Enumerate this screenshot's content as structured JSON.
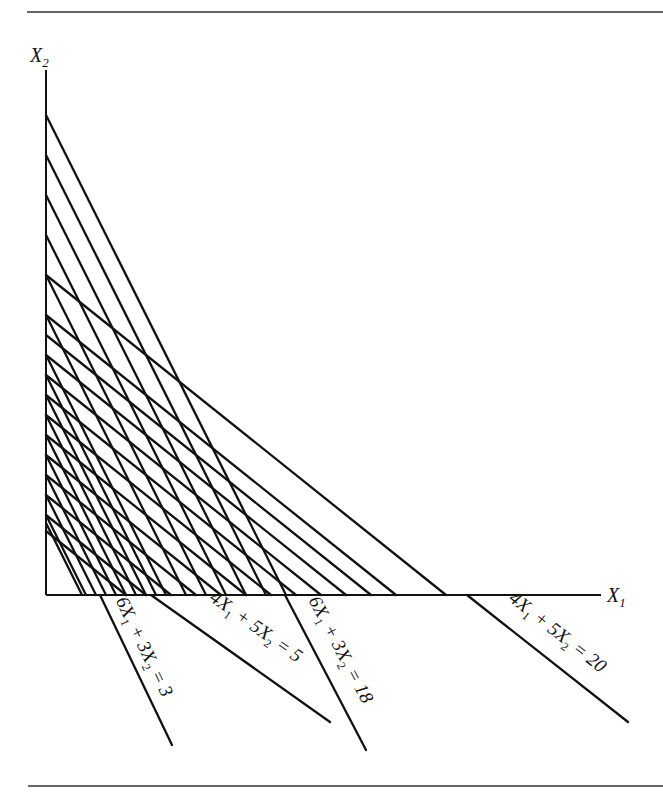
{
  "figure": {
    "top_rule": {
      "x1": 27,
      "x2": 663,
      "y": 12
    },
    "bottom_rule": {
      "x1": 28,
      "x2": 663,
      "y": 786
    },
    "origin": {
      "x": 46,
      "y": 595
    },
    "axes": {
      "x_axis": {
        "label": "X",
        "subscript": "1",
        "end_x": 601
      },
      "y_axis": {
        "label": "X",
        "subscript": "2",
        "end_y": 70
      }
    },
    "scale_px_per_unit": {
      "x": 80,
      "y": 80
    },
    "families": [
      {
        "name": "6X1 + 3X2 = c",
        "a": 6,
        "b": 3,
        "c_values": [
          2.7,
          3,
          3.75,
          4.5,
          5.25,
          6,
          6.75,
          7.5,
          8.25,
          9,
          10.5,
          12,
          13.5,
          15,
          16.5,
          18
        ],
        "note": "steep family (shaded iso-lines)"
      },
      {
        "name": "4X1 + 5X2 = c",
        "a": 4,
        "b": 5,
        "c_values": [
          4,
          5,
          6.25,
          7.5,
          8.75,
          10,
          11.25,
          12.5,
          13.75,
          15,
          16.25,
          17.5,
          20
        ],
        "note": "shallow family (shaded iso-lines)"
      }
    ],
    "line_labels": [
      {
        "id": "label-6x1-3x2-3",
        "parts": [
          "6X",
          "1",
          " + 3X",
          "2",
          " = 3"
        ],
        "text": "6X1 + 3X2 = 3",
        "x": 110,
        "y": 603,
        "end": [
          172,
          745
        ],
        "start_axis_x": 100
      },
      {
        "id": "label-4x1-5x2-5",
        "parts": [
          "4X",
          "1",
          " + 5X",
          "2",
          " = 5"
        ],
        "text": "4X1 + 5X2 = 5",
        "x": 205,
        "y": 605,
        "end": [
          330,
          722
        ],
        "start_axis_x": 151
      },
      {
        "id": "label-6x1-3x2-18",
        "parts": [
          "6X",
          "1",
          " + 3X",
          "2",
          " = 18"
        ],
        "text": "6X1 + 3X2 = 18",
        "x": 303,
        "y": 603,
        "end": [
          366,
          750
        ],
        "start_axis_x": 285
      },
      {
        "id": "label-4x1-5x2-20",
        "parts": [
          "4X",
          "1",
          " + 5X",
          "2",
          " = 20"
        ],
        "text": "4X1 + 5X2 = 20",
        "x": 504,
        "y": 605,
        "end": [
          628,
          722
        ],
        "start_axis_x": 467
      }
    ]
  }
}
